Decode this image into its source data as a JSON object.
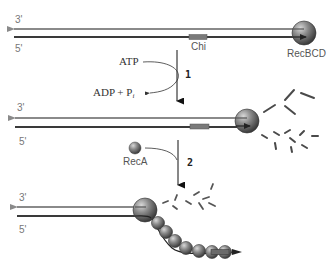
{
  "diagram": {
    "colors": {
      "top_strand": "#8a8a8a",
      "bottom_strand": "#3a3a3a",
      "chi_box": "#7a7a7a",
      "sphere": "#6e6e6e",
      "fragment": "#4a4a4a"
    },
    "panels": [
      {
        "id": "panel-1",
        "strand_top_label": "3'",
        "strand_bottom_label": "5'",
        "chi_label": "Chi",
        "enzyme_label": "RecBCD"
      },
      {
        "id": "panel-2",
        "strand_top_label": "3'",
        "strand_bottom_label": "5'"
      },
      {
        "id": "panel-3",
        "strand_top_label": "3'",
        "strand_bottom_label": "5'"
      }
    ],
    "steps": [
      {
        "number": "1",
        "input": "ATP",
        "output_main": "ADP + P",
        "output_sub": "i"
      },
      {
        "number": "2",
        "input": "RecA"
      }
    ]
  }
}
